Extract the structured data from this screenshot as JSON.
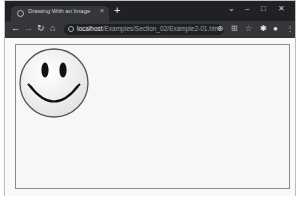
{
  "browser": {
    "tab": {
      "title": "Drawing With an Image",
      "close": "×",
      "favicon": "page-icon"
    },
    "new_tab": "+",
    "window_controls": {
      "tab_search": "⌄",
      "minimize": "–",
      "maximize": "□",
      "close": "✕"
    },
    "nav": {
      "back": "←",
      "forward": "→",
      "reload": "↻",
      "home": "⌂"
    },
    "address": {
      "host": "localhost",
      "path": "/Examples/Section_02/Example2-01.html"
    },
    "toolbar_icons": {
      "zoom": "⊕",
      "install": "⊞",
      "bookmark": "☆",
      "extensions": "✱",
      "profile": "●",
      "menu": "⋮"
    }
  },
  "page": {
    "canvas": {
      "image": "smiley-face",
      "colors": {
        "face_fill": "#f3f3f3",
        "face_stroke": "#555555",
        "features": "#111111"
      }
    }
  }
}
